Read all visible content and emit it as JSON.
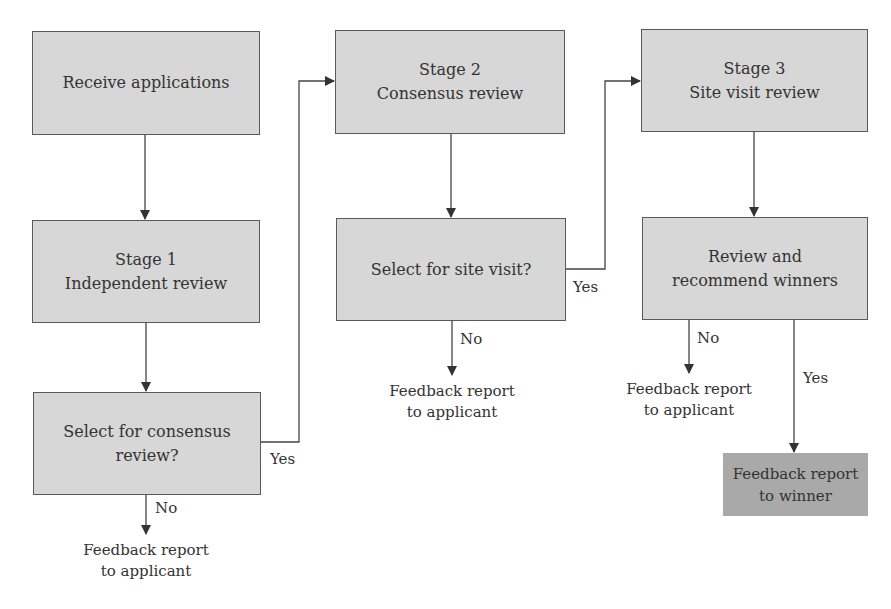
{
  "diagram": {
    "type": "flowchart",
    "colors": {
      "box_fill": "#d7d7d7",
      "box_border": "#5a5a5a",
      "winner_fill": "#a9a9a9",
      "line": "#444444",
      "text": "#333333"
    },
    "nodes": {
      "receive": {
        "lines": [
          "Receive applications"
        ]
      },
      "stage1": {
        "lines": [
          "Stage 1",
          "Independent review"
        ]
      },
      "select_consensus": {
        "lines": [
          "Select for consensus",
          "review?"
        ]
      },
      "stage2": {
        "lines": [
          "Stage 2",
          "Consensus review"
        ]
      },
      "select_site": {
        "lines": [
          "Select for site visit?"
        ]
      },
      "stage3": {
        "lines": [
          "Stage 3",
          "Site visit review"
        ]
      },
      "review_recommend": {
        "lines": [
          "Review and",
          "recommend winners"
        ]
      },
      "winner": {
        "lines": [
          "Feedback report",
          "to winner"
        ]
      }
    },
    "outcomes": {
      "feedback1": {
        "lines": [
          "Feedback report",
          "to applicant"
        ]
      },
      "feedback2": {
        "lines": [
          "Feedback report",
          "to applicant"
        ]
      },
      "feedback3": {
        "lines": [
          "Feedback report",
          "to applicant"
        ]
      }
    },
    "edge_labels": {
      "yes1": "Yes",
      "no1": "No",
      "yes2": "Yes",
      "no2": "No",
      "yes3": "Yes",
      "no3": "No"
    }
  }
}
